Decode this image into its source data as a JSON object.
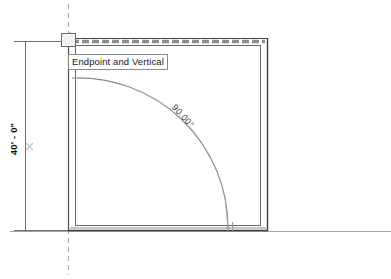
{
  "app": {
    "view_type": "floor-plan",
    "background_color": "#ffffff",
    "line_color": "#555555",
    "wall_color": "#3a3a3a",
    "highlight_color": "#909090",
    "text_color": "#111111"
  },
  "tooltip": {
    "label": "Endpoint and Vertical",
    "x": 68,
    "y": 54
  },
  "dimension": {
    "label": "40' - 0\"",
    "orientation": "vertical",
    "line_x": 25,
    "start_y": 41,
    "end_y": 230,
    "has_grip": true,
    "grip_symbol": "×"
  },
  "angle_annotation": {
    "label": "90.00°",
    "value": 90.0,
    "unit": "degrees",
    "rotation_deg": 47
  },
  "geometry": {
    "walls": {
      "outer_left": 68,
      "outer_top": 38,
      "outer_right": 268,
      "outer_bottom": 230,
      "thickness": 7
    },
    "door_swing": {
      "hinge_x": 70,
      "hinge_y": 228,
      "radius": 150,
      "start_angle": 90,
      "sweep": 90
    },
    "construction_line": {
      "type": "dashed-vertical",
      "x": 68,
      "from_y": 0,
      "to_y": 279
    },
    "reference_line": {
      "type": "solid-horizontal",
      "y": 230,
      "from_x": 10,
      "to_x": 391
    }
  },
  "icons": {
    "snap_marker": "endpoint-snap-icon"
  }
}
